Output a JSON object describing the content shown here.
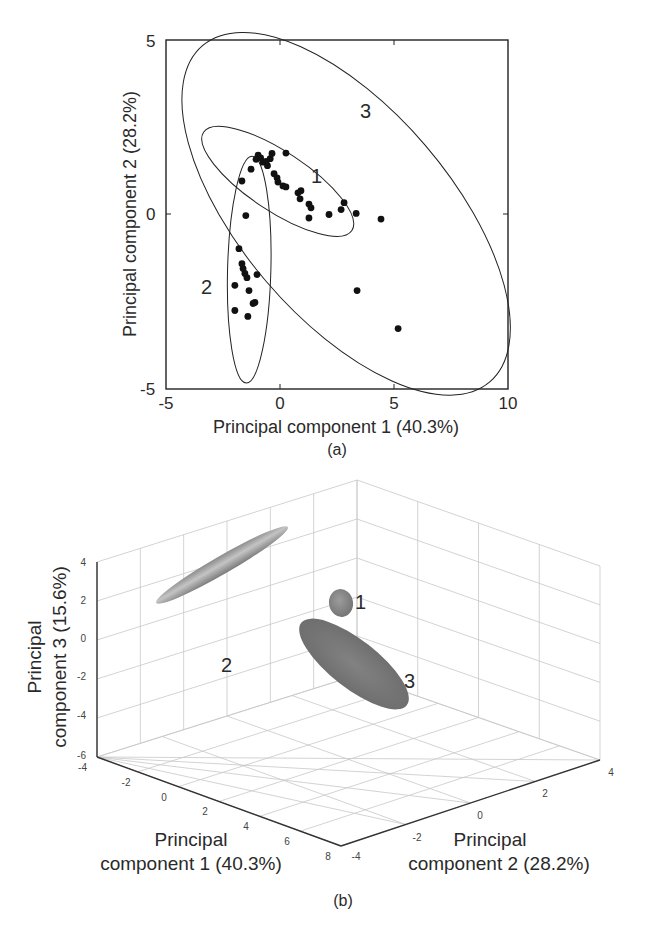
{
  "chart_data": [
    {
      "panel": "(a)",
      "type": "scatter",
      "title": "",
      "xlabel": "Principal component 1 (40.3%)",
      "ylabel": "Principal component 2 (28.2%)",
      "xlim": [
        -5,
        10
      ],
      "ylim": [
        -5,
        5
      ],
      "xticks": [
        -5,
        0,
        5,
        10
      ],
      "yticks": [
        -5,
        0,
        5
      ],
      "grid": false,
      "legend": null,
      "points": [
        {
          "x": -0.96,
          "y": 1.7
        },
        {
          "x": -1.05,
          "y": 1.58
        },
        {
          "x": -0.85,
          "y": 1.62
        },
        {
          "x": -0.75,
          "y": 1.5
        },
        {
          "x": -0.61,
          "y": 1.52
        },
        {
          "x": -0.43,
          "y": 1.6
        },
        {
          "x": -0.35,
          "y": 1.75
        },
        {
          "x": -0.55,
          "y": 1.4
        },
        {
          "x": 0.26,
          "y": 1.76
        },
        {
          "x": -1.27,
          "y": 1.3
        },
        {
          "x": -1.67,
          "y": 0.96
        },
        {
          "x": -0.26,
          "y": 1.17
        },
        {
          "x": -0.13,
          "y": 1.05
        },
        {
          "x": -0.09,
          "y": 0.93
        },
        {
          "x": 0.13,
          "y": 0.82
        },
        {
          "x": 0.26,
          "y": 0.79
        },
        {
          "x": 0.79,
          "y": 0.62
        },
        {
          "x": 0.92,
          "y": 0.68
        },
        {
          "x": 0.88,
          "y": 0.45
        },
        {
          "x": 1.27,
          "y": 0.3
        },
        {
          "x": 1.36,
          "y": 0.19
        },
        {
          "x": 1.27,
          "y": -0.1
        },
        {
          "x": 2.15,
          "y": 0.0
        },
        {
          "x": 2.68,
          "y": 0.14
        },
        {
          "x": 2.81,
          "y": 0.34
        },
        {
          "x": 3.34,
          "y": 0.03
        },
        {
          "x": 4.43,
          "y": -0.13
        },
        {
          "x": -1.5,
          "y": -0.03
        },
        {
          "x": -1.8,
          "y": -0.98
        },
        {
          "x": -1.67,
          "y": -1.41
        },
        {
          "x": -1.62,
          "y": -1.55
        },
        {
          "x": -1.54,
          "y": -1.69
        },
        {
          "x": -1.45,
          "y": -1.81
        },
        {
          "x": -1.01,
          "y": -1.72
        },
        {
          "x": -1.98,
          "y": -2.03
        },
        {
          "x": -1.36,
          "y": -2.18
        },
        {
          "x": -1.1,
          "y": -2.52
        },
        {
          "x": -1.18,
          "y": -2.55
        },
        {
          "x": -1.98,
          "y": -2.75
        },
        {
          "x": -1.41,
          "y": -2.92
        },
        {
          "x": 3.38,
          "y": -2.18
        },
        {
          "x": 5.18,
          "y": -3.27
        }
      ],
      "ellipses": [
        {
          "label": "1",
          "cx": -0.1,
          "cy": 0.95,
          "rx": 3.9,
          "ry": 0.85,
          "angle_px": 33.5,
          "label_x": 1.35,
          "label_y": 0.95
        },
        {
          "label": "2",
          "cx": -1.35,
          "cy": -1.58,
          "rx": 0.95,
          "ry": 3.25,
          "angle_px": 1.5,
          "label_x": -3.45,
          "label_y": -2.0
        },
        {
          "label": "3",
          "cx": 2.9,
          "cy": 0.02,
          "rx": 9.7,
          "ry": 3.0,
          "angle_px": 49.5,
          "label_x": 3.6,
          "label_y": 2.8
        }
      ]
    },
    {
      "panel": "(b)",
      "type": "scatter3d",
      "title": "",
      "xlabel": "Principal component 1 (40.3%)",
      "ylabel": "Principal component 2 (28.2%)",
      "zlabel": "Principal component 3 (15.6%)",
      "xlim": [
        -4,
        8
      ],
      "ylim": [
        -4,
        4
      ],
      "zlim": [
        -6,
        4
      ],
      "xticks": [
        -4,
        -2,
        0,
        2,
        4,
        6,
        8
      ],
      "yticks": [
        -4,
        -2,
        0,
        2,
        4
      ],
      "zticks": [
        -6,
        -4,
        -2,
        0,
        2,
        4
      ],
      "grid": true,
      "ellipsoids": [
        {
          "label": "1",
          "description": "small ellipsoid near PC1≈0, PC2≈1, PC3≈1",
          "shade": "#8a8a8a"
        },
        {
          "label": "2",
          "description": "long thin ellipsoid, elongated along PC2 axis",
          "shade": "#9a9a9a"
        },
        {
          "label": "3",
          "description": "large flattened ellipsoid",
          "shade": "#7d7d7d"
        }
      ]
    }
  ],
  "panel_a": {
    "caption": "(a)",
    "xlabel": "Principal component 1 (40.3%)",
    "ylabel": "Principal component 2 (28.2%)",
    "xticks": [
      "-5",
      "0",
      "5",
      "10"
    ],
    "yticks": [
      "5",
      "0",
      "-5"
    ],
    "cluster_labels": [
      "1",
      "2",
      "3"
    ]
  },
  "panel_b": {
    "caption": "(b)",
    "xlabel_line1": "Principal",
    "xlabel_line2": "component 1 (40.3%)",
    "ylabel_line1": "Principal",
    "ylabel_line2": "component 2 (28.2%)",
    "zlabel_line1": "Principal",
    "zlabel_line2": "component 3 (15.6%)",
    "xticks": [
      "-4",
      "-2",
      "0",
      "2",
      "4",
      "6",
      "8"
    ],
    "yticks": [
      "-4",
      "-2",
      "0",
      "2",
      "4"
    ],
    "zticks": [
      "4",
      "2",
      "0",
      "-2",
      "-4",
      "-6"
    ],
    "cluster_labels": [
      "1",
      "2",
      "3"
    ]
  }
}
